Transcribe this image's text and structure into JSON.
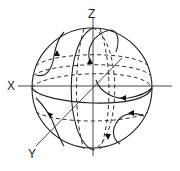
{
  "figure": {
    "type": "3D sphere phase portrait",
    "axes": {
      "x_label": "X",
      "y_label": "Y",
      "z_label": "Z"
    },
    "elements": {
      "sphere_outline": "circle",
      "equator": "ellipse (solid front, dashed back)",
      "meridians": "vertical ellipses (solid front, dashed back)",
      "latitude_lines": "dashed horizontal ellipses",
      "trajectories": "curves with direction arrows"
    },
    "colors": {
      "line": "#222222",
      "background": "#ffffff"
    }
  }
}
